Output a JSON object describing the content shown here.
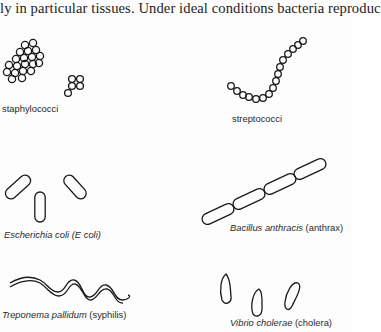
{
  "page": {
    "body_text": "ly in particular tissues. Under ideal conditions bacteria reproduc"
  },
  "figure": {
    "specimens": [
      {
        "id": "staphylococci",
        "label_italic": "",
        "label_plain": "staphylococci"
      },
      {
        "id": "streptococci",
        "label_italic": "",
        "label_plain": "streptococci"
      },
      {
        "id": "escherichia-coli",
        "label_italic": "Escherichia coli (E coli)",
        "label_plain": ""
      },
      {
        "id": "bacillus-anthracis",
        "label_italic": "Bacillus anthracis",
        "label_plain": " (anthrax)"
      },
      {
        "id": "treponema-pallidum",
        "label_italic": "Treponema pallidum",
        "label_plain": " (syphilis)"
      },
      {
        "id": "vibrio-cholerae",
        "label_italic": "Vibrio cholerae",
        "label_plain": " (cholera)"
      }
    ]
  },
  "colors": {
    "ink": "#1a1a1a",
    "paper": "#fdfdfd"
  }
}
